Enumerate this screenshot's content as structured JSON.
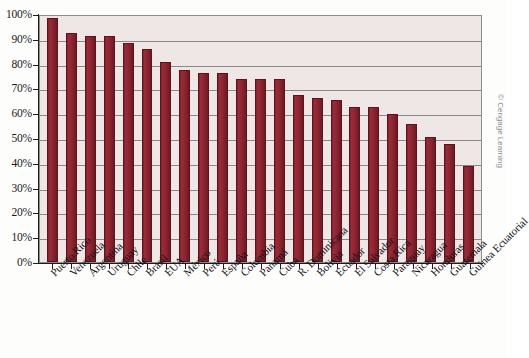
{
  "chart_data": {
    "type": "bar",
    "title": "",
    "subtitle": "",
    "xlabel": "",
    "ylabel": "",
    "ylim": [
      0,
      100
    ],
    "grid": true,
    "legend": null,
    "y_tick_labels": [
      "100%",
      "90%",
      "80%",
      "70%",
      "60%",
      "50%",
      "40%",
      "30%",
      "20%",
      "10%",
      "0%"
    ],
    "y_tick_values": [
      100,
      90,
      80,
      70,
      60,
      50,
      40,
      30,
      20,
      10,
      0
    ],
    "categories": [
      "Puerto Rico",
      "Venezuela",
      "Argentina",
      "Uruguay",
      "Chile",
      "Brasil",
      "EUA",
      "México",
      "Perú",
      "España",
      "Colombia",
      "Panamá",
      "Cuba",
      "R. Dominicana",
      "Bolivia",
      "Ecuador",
      "El Salvador",
      "Costa Rica",
      "Paraguay",
      "Nicaragua",
      "Honduras",
      "Guatemala",
      "Guinea Ecuatorial"
    ],
    "values": [
      99,
      93,
      92,
      92,
      89,
      86.5,
      81.5,
      78,
      77,
      77,
      74.5,
      74.5,
      74.5,
      68,
      66.5,
      66,
      63,
      63,
      60,
      56,
      51,
      48,
      39
    ],
    "series": [
      {
        "name": "",
        "values": [
          99,
          93,
          92,
          92,
          89,
          86.5,
          81.5,
          78,
          77,
          77,
          74.5,
          74.5,
          74.5,
          68,
          66.5,
          66,
          63,
          63,
          60,
          56,
          51,
          48,
          39
        ]
      }
    ]
  },
  "colors": {
    "bar_fill": "#8d2430",
    "bar_border": "#5d141d",
    "plot_background": "#efe6e6",
    "gridline": "#8a8a8a",
    "axis": "#1d1d1d",
    "page_background": "#fdfdfc",
    "credit_text": "#8d8d8d"
  },
  "credit": {
    "text": "© Cengage Learning"
  }
}
